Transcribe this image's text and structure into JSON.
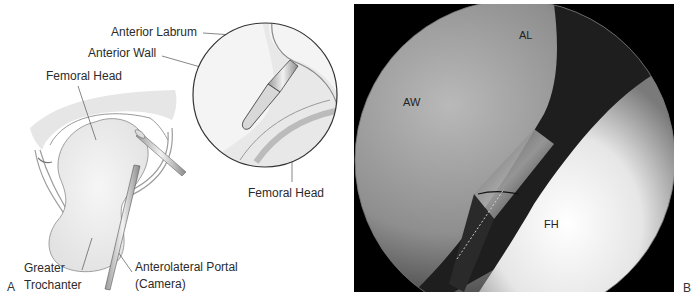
{
  "panel_a": {
    "letter": "A",
    "labels": {
      "anterior_labrum": "Anterior Labrum",
      "anterior_wall": "Anterior Wall",
      "femoral_head_left": "Femoral Head",
      "femoral_head_right": "Femoral Head",
      "greater": "Greater",
      "trochanter": "Trochanter",
      "portal_line1": "Anterolateral Portal",
      "portal_line2": "(Camera)"
    }
  },
  "panel_b": {
    "letter": "B",
    "labels": {
      "al": "AL",
      "aw": "AW",
      "fh": "FH"
    }
  },
  "colors": {
    "background": "#ffffff",
    "bone": "#efefef",
    "outline": "#555555",
    "photo_bg": "#000000"
  }
}
